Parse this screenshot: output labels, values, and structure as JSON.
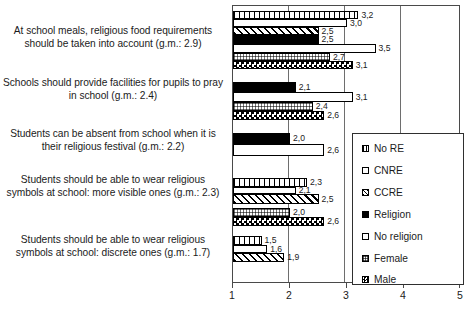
{
  "chart_data": {
    "type": "bar",
    "orientation": "horizontal",
    "title": "",
    "xlabel": "",
    "ylabel": "",
    "xlim": [
      1,
      5
    ],
    "xticks": [
      "1",
      "2",
      "3",
      "4",
      "5"
    ],
    "grid": true,
    "legend_position": "right-bottom",
    "legend": [
      "No RE",
      "CNRE",
      "CCRE",
      "Religion",
      "No religion",
      "Female",
      "Male"
    ],
    "categories": [
      "At school meals, religious food requirements should be taken into account (g.m.: 2.9)",
      "Schools should provide facilities for pupils to pray in school (g.m.: 2.4)",
      "Students can be absent from school when it is their religious festival (g.m.: 2.2)",
      "Students should be able to wear religious symbols at school: more visible ones (g.m.: 2.3)",
      "Students should be able to wear religious symbols at school: discrete ones (g.m.: 1.7)"
    ],
    "series": [
      {
        "name": "No RE",
        "values": [
          3.2,
          null,
          null,
          2.3,
          1.5
        ]
      },
      {
        "name": "CNRE",
        "values": [
          3.0,
          null,
          null,
          2.1,
          1.6
        ]
      },
      {
        "name": "CCRE",
        "values": [
          2.5,
          null,
          null,
          2.5,
          1.9
        ]
      },
      {
        "name": "Religion",
        "values": [
          2.5,
          2.1,
          2.0,
          null,
          null
        ]
      },
      {
        "name": "No religion",
        "values": [
          3.5,
          3.1,
          2.6,
          null,
          null
        ]
      },
      {
        "name": "Female",
        "values": [
          2.7,
          2.4,
          null,
          2.0,
          null
        ]
      },
      {
        "name": "Male",
        "values": [
          3.1,
          2.6,
          null,
          2.6,
          null
        ]
      }
    ]
  },
  "groups": [
    {
      "label": "At school meals, religious food requirements should be taken into account (g.m.: 2.9)",
      "label_top": 24,
      "bars": [
        {
          "series": "No RE",
          "pattern": "pat-norE",
          "value": 3.2,
          "value_text": "3,2",
          "top": 5,
          "height": 8
        },
        {
          "series": "CNRE",
          "pattern": "pat-cnre",
          "value": 3.0,
          "value_text": "3,0",
          "top": 13,
          "height": 8
        },
        {
          "series": "CCRE",
          "pattern": "pat-ccre",
          "value": 2.5,
          "value_text": "2,5",
          "top": 21,
          "height": 8
        },
        {
          "series": "Religion",
          "pattern": "pat-religion",
          "value": 2.5,
          "value_text": "2,5",
          "top": 29,
          "height": 9
        },
        {
          "series": "No religion",
          "pattern": "pat-noreligion",
          "value": 3.5,
          "value_text": "3,5",
          "top": 38,
          "height": 9
        },
        {
          "series": "Female",
          "pattern": "pat-female",
          "value": 2.7,
          "value_text": "2,7",
          "top": 47,
          "height": 8
        },
        {
          "series": "Male",
          "pattern": "pat-male",
          "value": 3.1,
          "value_text": "3,1",
          "top": 55,
          "height": 8
        }
      ]
    },
    {
      "label": "Schools should provide facilities for pupils to pray in school (g.m.: 2.4)",
      "label_top": 76,
      "bars": [
        {
          "series": "Religion",
          "pattern": "pat-religion",
          "value": 2.1,
          "value_text": "2,1",
          "top": 76,
          "height": 10
        },
        {
          "series": "No religion",
          "pattern": "pat-noreligion",
          "value": 3.1,
          "value_text": "3,1",
          "top": 86,
          "height": 10
        },
        {
          "series": "Female",
          "pattern": "pat-female",
          "value": 2.4,
          "value_text": "2,4",
          "top": 96,
          "height": 9
        },
        {
          "series": "Male",
          "pattern": "pat-male",
          "value": 2.6,
          "value_text": "2,6",
          "top": 105,
          "height": 9
        }
      ]
    },
    {
      "label": "Students can be absent from school when it is their religious festival (g.m.: 2.2)",
      "label_top": 127,
      "bars": [
        {
          "series": "Religion",
          "pattern": "pat-religion",
          "value": 2.0,
          "value_text": "2,0",
          "top": 127,
          "height": 11
        },
        {
          "series": "No religion",
          "pattern": "pat-noreligion",
          "value": 2.6,
          "value_text": "2,6",
          "top": 138,
          "height": 12
        }
      ]
    },
    {
      "label": "Students should be able to wear religious symbols at school: more visible ones (g.m.: 2.3)",
      "label_top": 173,
      "bars": [
        {
          "series": "No RE",
          "pattern": "pat-norE",
          "value": 2.3,
          "value_text": "2,3",
          "top": 172,
          "height": 9
        },
        {
          "series": "CNRE",
          "pattern": "pat-cnre",
          "value": 2.1,
          "value_text": "2,1",
          "top": 181,
          "height": 7
        },
        {
          "series": "CCRE",
          "pattern": "pat-ccre",
          "value": 2.5,
          "value_text": "2,5",
          "top": 188,
          "height": 10
        },
        {
          "series": "Female",
          "pattern": "pat-female",
          "value": 2.0,
          "value_text": "2,0",
          "top": 202,
          "height": 9
        },
        {
          "series": "Male",
          "pattern": "pat-male",
          "value": 2.6,
          "value_text": "2,6",
          "top": 211,
          "height": 9
        }
      ]
    },
    {
      "label": "Students should be able to wear religious symbols at school: discrete ones (g.m.: 1.7)",
      "label_top": 233,
      "bars": [
        {
          "series": "No RE",
          "pattern": "pat-norE",
          "value": 1.5,
          "value_text": "1,5",
          "top": 230,
          "height": 9
        },
        {
          "series": "CNRE",
          "pattern": "pat-cnre",
          "value": 1.6,
          "value_text": "1,6",
          "top": 239,
          "height": 8
        },
        {
          "series": "CCRE",
          "pattern": "pat-ccre",
          "value": 1.9,
          "value_text": "1,9",
          "top": 247,
          "height": 9
        }
      ]
    }
  ],
  "axis": {
    "ticks": [
      {
        "label": "1",
        "value": 1
      },
      {
        "label": "2",
        "value": 2
      },
      {
        "label": "3",
        "value": 3
      },
      {
        "label": "4",
        "value": 4
      },
      {
        "label": "5",
        "value": 5
      }
    ]
  },
  "legend": {
    "items": [
      {
        "label": "No RE",
        "swatch": "sw-norE",
        "top": 9
      },
      {
        "label": "CNRE",
        "swatch": "sw-cnre",
        "top": 31
      },
      {
        "label": "CCRE",
        "swatch": "sw-ccre",
        "top": 53
      },
      {
        "label": "Religion",
        "swatch": "sw-religion",
        "top": 75
      },
      {
        "label": "No religion",
        "swatch": "sw-noreligion",
        "top": 97
      },
      {
        "label": "Female",
        "swatch": "sw-female",
        "top": 119
      },
      {
        "label": "Male",
        "swatch": "sw-male",
        "top": 140
      }
    ]
  },
  "colors": {
    "frame": "#4a4a4a",
    "grid": "#6e6e6e",
    "text": "#1b1b1b",
    "bar_outline": "#000000",
    "fill_solid": "#000000",
    "background": "#ffffff"
  }
}
